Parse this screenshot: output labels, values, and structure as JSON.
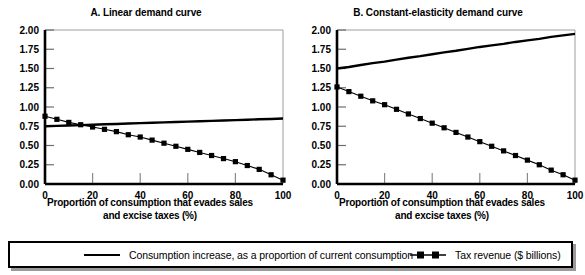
{
  "figure": {
    "legend": {
      "series": [
        {
          "key": "consumption",
          "label": "Consumption increase, as a proportion of current consumption",
          "marker": "line-only",
          "color": "#000000"
        },
        {
          "key": "tax_revenue",
          "label": "Tax revenue ($ billions)",
          "marker": "line-square",
          "color": "#000000"
        }
      ]
    },
    "panels": [
      {
        "id": "a",
        "title": "A. Linear demand curve",
        "xlabel_line1": "Proportion of consumption that evades sales",
        "xlabel_line2": "and excise taxes (%)"
      },
      {
        "id": "b",
        "title": "B. Constant-elasticity demand curve",
        "xlabel_line1": "Proportion of consumption that evades sales",
        "xlabel_line2": "and excise taxes (%)"
      }
    ]
  },
  "chart_data": [
    {
      "type": "line",
      "panel": "A",
      "title": "A. Linear demand curve",
      "xlabel": "Proportion of consumption that evades sales and excise taxes (%)",
      "ylabel": "",
      "xlim": [
        0,
        100
      ],
      "ylim": [
        0,
        2.0
      ],
      "xticks": [
        0,
        20,
        40,
        60,
        80,
        100
      ],
      "yticks": [
        0.0,
        0.25,
        0.5,
        0.75,
        1.0,
        1.25,
        1.5,
        1.75,
        2.0
      ],
      "ytick_labels": [
        "0.00",
        "0.25",
        "0.50",
        "0.75",
        "1.00",
        "1.25",
        "1.50",
        "1.75",
        "2.00"
      ],
      "xtick_labels": [
        "0",
        "20",
        "40",
        "60",
        "80",
        "100"
      ],
      "grid": false,
      "legend_position": "below-figure",
      "x": [
        0,
        5,
        10,
        15,
        20,
        25,
        30,
        35,
        40,
        45,
        50,
        55,
        60,
        65,
        70,
        75,
        80,
        85,
        90,
        95,
        100
      ],
      "series": [
        {
          "name": "Consumption increase, as a proportion of current consumption",
          "marker": "none",
          "values": [
            0.75,
            0.755,
            0.76,
            0.765,
            0.77,
            0.775,
            0.78,
            0.785,
            0.79,
            0.795,
            0.8,
            0.805,
            0.81,
            0.815,
            0.82,
            0.825,
            0.83,
            0.835,
            0.84,
            0.845,
            0.85
          ]
        },
        {
          "name": "Tax revenue ($ billions)",
          "marker": "square",
          "values": [
            0.88,
            0.84,
            0.8,
            0.77,
            0.74,
            0.71,
            0.68,
            0.64,
            0.61,
            0.57,
            0.53,
            0.49,
            0.45,
            0.41,
            0.37,
            0.33,
            0.29,
            0.24,
            0.19,
            0.12,
            0.05
          ]
        }
      ]
    },
    {
      "type": "line",
      "panel": "B",
      "title": "B. Constant-elasticity demand curve",
      "xlabel": "Proportion of consumption that evades sales and excise taxes (%)",
      "ylabel": "",
      "xlim": [
        0,
        100
      ],
      "ylim": [
        0,
        2.0
      ],
      "xticks": [
        0,
        20,
        40,
        60,
        80,
        100
      ],
      "yticks": [
        0.0,
        0.25,
        0.5,
        0.75,
        1.0,
        1.25,
        1.5,
        1.75,
        2.0
      ],
      "ytick_labels": [
        "0.00",
        "0.25",
        "0.50",
        "0.75",
        "1.00",
        "1.25",
        "1.50",
        "1.75",
        "2.00"
      ],
      "xtick_labels": [
        "0",
        "20",
        "40",
        "60",
        "80",
        "100"
      ],
      "grid": false,
      "legend_position": "below-figure",
      "x": [
        0,
        5,
        10,
        15,
        20,
        25,
        30,
        35,
        40,
        45,
        50,
        55,
        60,
        65,
        70,
        75,
        80,
        85,
        90,
        95,
        100
      ],
      "series": [
        {
          "name": "Consumption increase, as a proportion of current consumption",
          "marker": "none",
          "values": [
            1.5,
            1.52,
            1.545,
            1.57,
            1.59,
            1.615,
            1.64,
            1.66,
            1.685,
            1.71,
            1.73,
            1.755,
            1.78,
            1.8,
            1.82,
            1.845,
            1.865,
            1.885,
            1.91,
            1.93,
            1.95
          ]
        },
        {
          "name": "Tax revenue ($ billions)",
          "marker": "square",
          "values": [
            1.26,
            1.2,
            1.14,
            1.08,
            1.03,
            0.97,
            0.91,
            0.85,
            0.79,
            0.73,
            0.67,
            0.61,
            0.55,
            0.49,
            0.43,
            0.37,
            0.31,
            0.25,
            0.18,
            0.12,
            0.05
          ]
        }
      ]
    }
  ]
}
